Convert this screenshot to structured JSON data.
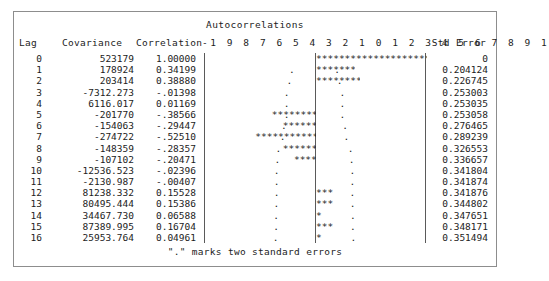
{
  "title": "Autocorrelations",
  "footnote": "\".\" marks two standard errors",
  "headers": {
    "lag": "Lag",
    "covariance": "Covariance",
    "correlation": "Correlation",
    "axis": "-1 9 8 7 6 5 4 3 2 1 0 1 2 3 4 5 6 7 8 9 1",
    "std_error": "Std Error"
  },
  "chart_data": {
    "type": "bar",
    "title": "Autocorrelations",
    "xlabel": "",
    "ylabel": "Lag",
    "xlim": [
      -1,
      1
    ],
    "grid": false,
    "legend": null,
    "orientation": "horizontal",
    "axis_ticks": [
      "-1",
      "9",
      "8",
      "7",
      "6",
      "5",
      "4",
      "3",
      "2",
      "1",
      "0",
      "1",
      "2",
      "3",
      "4",
      "5",
      "6",
      "7",
      "8",
      "9",
      "1"
    ],
    "stars_per_unit": 20,
    "categories": [
      0,
      1,
      2,
      3,
      4,
      5,
      6,
      7,
      8,
      9,
      10,
      11,
      12,
      13,
      14,
      15,
      16
    ],
    "values": [
      1.0,
      0.34199,
      0.3888,
      -0.01398,
      0.01169,
      -0.38566,
      -0.29447,
      -0.5251,
      -0.28357,
      -0.20471,
      -0.02396,
      -0.00407,
      0.15528,
      0.15386,
      0.06588,
      0.16704,
      0.04961
    ],
    "star_counts": [
      20,
      7,
      8,
      0,
      0,
      -8,
      -6,
      -11,
      -6,
      -4,
      0,
      0,
      3,
      3,
      1,
      3,
      1
    ],
    "series": [
      {
        "name": "Covariance",
        "values": [
          523179,
          178924,
          203414,
          -7312.273,
          6116.017,
          -201770,
          -154063,
          -274722,
          -148359,
          -107102,
          -12536.523,
          -2130.987,
          81238.332,
          80495.444,
          34467.73,
          87389.995,
          25953.764
        ]
      },
      {
        "name": "Correlation",
        "values": [
          1.0,
          0.34199,
          0.3888,
          -0.01398,
          0.01169,
          -0.38566,
          -0.29447,
          -0.5251,
          -0.28357,
          -0.20471,
          -0.02396,
          -0.00407,
          0.15528,
          0.15386,
          0.06588,
          0.16704,
          0.04961
        ]
      },
      {
        "name": "Std Error",
        "values": [
          0,
          0.204124,
          0.226745,
          0.253003,
          0.253035,
          0.253058,
          0.276465,
          0.289239,
          0.326553,
          0.336657,
          0.341804,
          0.341874,
          0.341876,
          0.344802,
          0.347651,
          0.348171,
          0.351494
        ]
      }
    ]
  },
  "rows": [
    {
      "lag": "0",
      "covariance": "523179",
      "correlation": "1.00000",
      "std_error": "0",
      "stars": 20,
      "se": 0
    },
    {
      "lag": "1",
      "covariance": "178924",
      "correlation": "0.34199",
      "std_error": "0.204124",
      "stars": 7,
      "se": 0.204124
    },
    {
      "lag": "2",
      "covariance": "203414",
      "correlation": "0.38880",
      "std_error": "0.226745",
      "stars": 8,
      "se": 0.226745
    },
    {
      "lag": "3",
      "covariance": "-7312.273",
      "correlation": "-.01398",
      "std_error": "0.253003",
      "stars": 0,
      "se": 0.253003
    },
    {
      "lag": "4",
      "covariance": "6116.017",
      "correlation": "0.01169",
      "std_error": "0.253035",
      "stars": 0,
      "se": 0.253035
    },
    {
      "lag": "5",
      "covariance": "-201770",
      "correlation": "-.38566",
      "std_error": "0.253058",
      "stars": -8,
      "se": 0.253058
    },
    {
      "lag": "6",
      "covariance": "-154063",
      "correlation": "-.29447",
      "std_error": "0.276465",
      "stars": -6,
      "se": 0.276465
    },
    {
      "lag": "7",
      "covariance": "-274722",
      "correlation": "-.52510",
      "std_error": "0.289239",
      "stars": -11,
      "se": 0.289239
    },
    {
      "lag": "8",
      "covariance": "-148359",
      "correlation": "-.28357",
      "std_error": "0.326553",
      "stars": -6,
      "se": 0.326553
    },
    {
      "lag": "9",
      "covariance": "-107102",
      "correlation": "-.20471",
      "std_error": "0.336657",
      "stars": -4,
      "se": 0.336657
    },
    {
      "lag": "10",
      "covariance": "-12536.523",
      "correlation": "-.02396",
      "std_error": "0.341804",
      "stars": 0,
      "se": 0.341804
    },
    {
      "lag": "11",
      "covariance": "-2130.987",
      "correlation": "-.00407",
      "std_error": "0.341874",
      "stars": 0,
      "se": 0.341874
    },
    {
      "lag": "12",
      "covariance": "81238.332",
      "correlation": "0.15528",
      "std_error": "0.341876",
      "stars": 3,
      "se": 0.341876
    },
    {
      "lag": "13",
      "covariance": "80495.444",
      "correlation": "0.15386",
      "std_error": "0.344802",
      "stars": 3,
      "se": 0.344802
    },
    {
      "lag": "14",
      "covariance": "34467.730",
      "correlation": "0.06588",
      "std_error": "0.347651",
      "stars": 1,
      "se": 0.347651
    },
    {
      "lag": "15",
      "covariance": "87389.995",
      "correlation": "0.16704",
      "std_error": "0.348171",
      "stars": 3,
      "se": 0.348171
    },
    {
      "lag": "16",
      "covariance": "25953.764",
      "correlation": "0.04961",
      "std_error": "0.351494",
      "stars": 1,
      "se": 0.351494
    }
  ]
}
